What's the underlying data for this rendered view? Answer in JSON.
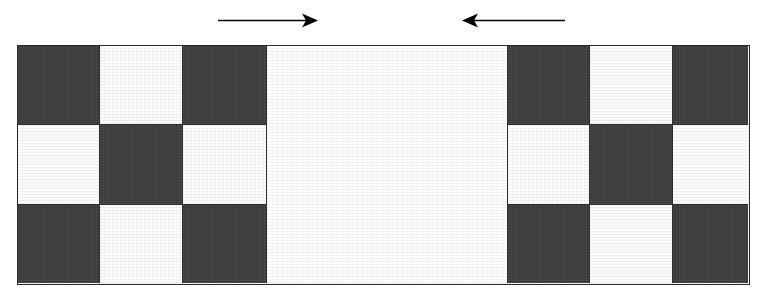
{
  "figure": {
    "type": "schematic-diagram",
    "background_color": "#ffffff"
  },
  "colors": {
    "dark_cell": "#3c3c3c",
    "light_cell": "#f1f1f1",
    "outline": "#2b2b2b",
    "rule": "#2f2f2f",
    "arrow": "#000000"
  },
  "arrows": [
    {
      "name": "load-arrow-right",
      "direction": "right",
      "x_start": 218,
      "x_end": 318,
      "y": 20,
      "head": "filled-barbed",
      "label": ""
    },
    {
      "name": "load-arrow-left",
      "direction": "left",
      "x_start": 565,
      "x_end": 462,
      "y": 20,
      "head": "filled-barbed",
      "label": ""
    }
  ],
  "specimen": {
    "x": 17,
    "y": 45,
    "width": 733,
    "height": 240,
    "rows": 3,
    "row_edges": [
      45,
      124,
      204,
      285
    ],
    "left_block": {
      "column_edges": [
        17,
        99,
        182,
        265
      ],
      "pattern": [
        [
          "dark",
          "light",
          "dark"
        ],
        [
          "light",
          "dark",
          "light"
        ],
        [
          "dark",
          "light",
          "dark"
        ]
      ]
    },
    "center_band": {
      "x_start": 265,
      "x_end": 508,
      "fill": "light",
      "spans_all_rows": true
    },
    "right_block": {
      "column_edges": [
        508,
        590,
        673,
        750
      ],
      "pattern": [
        [
          "dark",
          "light",
          "dark"
        ],
        [
          "light",
          "dark",
          "light"
        ],
        [
          "dark",
          "light",
          "dark"
        ]
      ]
    }
  }
}
